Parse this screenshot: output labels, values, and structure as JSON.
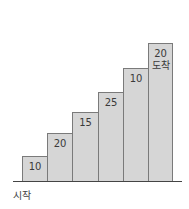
{
  "diagram": {
    "type": "staircase",
    "start_label": "시작",
    "steps": [
      {
        "label": "10",
        "sub": ""
      },
      {
        "label": "20",
        "sub": ""
      },
      {
        "label": "15",
        "sub": ""
      },
      {
        "label": "25",
        "sub": ""
      },
      {
        "label": "10",
        "sub": ""
      },
      {
        "label": "20",
        "sub": "도착"
      }
    ],
    "colors": {
      "fill": "#d6d6d6",
      "border": "#7a7a7a",
      "baseline": "#444444"
    }
  }
}
